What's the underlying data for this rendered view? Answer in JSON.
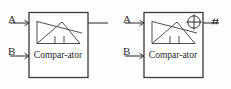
{
  "figure": {
    "background_color": "#fdfdfd",
    "line_color": "#3a3a3a",
    "text_color": "#1f1f1f",
    "panel_count": 2
  },
  "panels": [
    {
      "id": "comparator-unselected",
      "block_caption": "Compar-ator",
      "input_ports": [
        {
          "label": "A"
        },
        {
          "label": "B"
        }
      ],
      "output_ports": [
        {
          "label": ""
        }
      ],
      "icons": [],
      "internal_symbol": {
        "name": "comparator-waveform-symbol",
        "description": "triangle ramp waveform with crossing threshold line and two pulse ticks"
      }
    },
    {
      "id": "comparator-with-cursor",
      "block_caption": "Compar-ator",
      "input_ports": [
        {
          "label": "A"
        },
        {
          "label": "B"
        }
      ],
      "output_ports": [
        {
          "label": ""
        }
      ],
      "icons": [
        {
          "name": "crosshair-target-icon",
          "glyph": "circle-with-cross"
        },
        {
          "name": "move-cursor-icon",
          "glyph": "#"
        }
      ],
      "internal_symbol": {
        "name": "comparator-waveform-symbol",
        "description": "triangle ramp waveform with crossing threshold line and two pulse ticks"
      }
    }
  ]
}
